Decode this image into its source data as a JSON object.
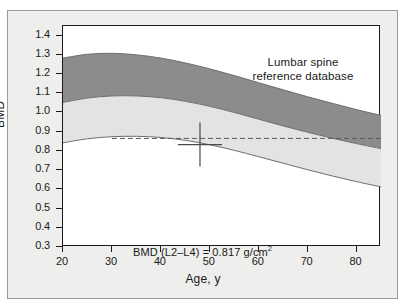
{
  "figure": {
    "background_color": "#eeeeec",
    "plot_background_color": "#ffffff",
    "axis_color": "#1b1b1b"
  },
  "chart_data": {
    "type": "area",
    "title": "Lumbar spine reference database",
    "title_line1": "Lumbar spine",
    "title_line2": "reference database",
    "xlabel": "Age, y",
    "ylabel": "BMD",
    "xlim": [
      20,
      85
    ],
    "ylim": [
      0.3,
      1.45
    ],
    "xticks": [
      20,
      30,
      40,
      50,
      60,
      70,
      80
    ],
    "xtick_labels": [
      "20",
      "30",
      "40",
      "50",
      "60",
      "70",
      "80"
    ],
    "yticks": [
      0.3,
      0.4,
      0.5,
      0.6,
      0.7,
      0.8,
      0.9,
      1.0,
      1.1,
      1.2,
      1.3,
      1.4
    ],
    "ytick_labels": [
      "0.3",
      "0.4",
      "0.5",
      "0.6",
      "0.7",
      "0.8",
      "0.9",
      "1.0",
      "1.1",
      "1.2",
      "1.3",
      "1.4"
    ],
    "grid": false,
    "legend": "none",
    "x": [
      20,
      25,
      30,
      35,
      40,
      45,
      50,
      55,
      60,
      65,
      70,
      75,
      80,
      85
    ],
    "series": [
      {
        "name": "upper-band-top",
        "label": "+2 SD boundary",
        "color": "#8c8c8c",
        "values": [
          1.283,
          1.303,
          1.308,
          1.3,
          1.283,
          1.258,
          1.227,
          1.192,
          1.155,
          1.118,
          1.082,
          1.048,
          1.015,
          0.985
        ]
      },
      {
        "name": "upper-band-bottom",
        "label": "mean / band split",
        "color": "#8c8c8c",
        "values": [
          1.052,
          1.075,
          1.086,
          1.086,
          1.077,
          1.058,
          1.032,
          1.0,
          0.965,
          0.93,
          0.897,
          0.866,
          0.838,
          0.812
        ]
      },
      {
        "name": "lower-band-bottom",
        "label": "-2 SD boundary",
        "color": "#cfcfcd",
        "values": [
          0.842,
          0.863,
          0.874,
          0.876,
          0.87,
          0.855,
          0.832,
          0.803,
          0.77,
          0.736,
          0.702,
          0.67,
          0.64,
          0.613
        ]
      }
    ],
    "bands": [
      {
        "name": "upper-band",
        "fill": "#8c8c8c",
        "description": "dark gray band between upper-band-top and upper-band-bottom"
      },
      {
        "name": "lower-band",
        "fill": "#e3e3e1",
        "description": "light gray band between upper-band-bottom and lower-band-bottom"
      }
    ],
    "reference_line": {
      "name": "patient-bmd-reference-line",
      "style": "dashed",
      "value": 0.865,
      "color": "#5a5a5a",
      "x_start": 30,
      "x_end": 85
    },
    "marker": {
      "name": "patient-measurement-marker",
      "style": "crosshair",
      "x": 48,
      "y": 0.833,
      "color": "#4a4a4a"
    },
    "annotations": [
      {
        "name": "bmd-value-annotation",
        "text_prefix": "BMD (L2–L4) = 0.817 g/cm",
        "text_superscript": "2",
        "full_text": "BMD (L2–L4) = 0.817 g/cm2"
      }
    ]
  }
}
